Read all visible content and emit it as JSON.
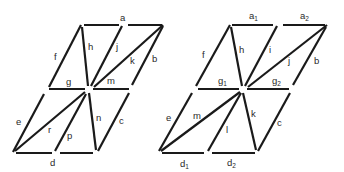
{
  "diagrams": [
    {
      "id": "left",
      "labels": {
        "a": "a",
        "b": "b",
        "c": "c",
        "d": "d",
        "e": "e",
        "f": "f",
        "g": "g",
        "h": "h",
        "j": "j",
        "k": "k",
        "m": "m",
        "n": "n",
        "p": "p",
        "r": "r"
      }
    },
    {
      "id": "right",
      "labels": {
        "a1": "a",
        "a1_sub": "1",
        "a2": "a",
        "a2_sub": "2",
        "b": "b",
        "c": "c",
        "d1": "d",
        "d1_sub": "1",
        "d2": "d",
        "d2_sub": "2",
        "e": "e",
        "f": "f",
        "g1": "g",
        "g1_sub": "1",
        "g2": "g",
        "g2_sub": "2",
        "h": "h",
        "i": "i",
        "j": "j",
        "k": "k",
        "l": "l",
        "m": "m"
      }
    }
  ],
  "colors": {
    "stroke": "#1a1a1a",
    "label": "#2a2a2a",
    "background": "#ffffff"
  }
}
